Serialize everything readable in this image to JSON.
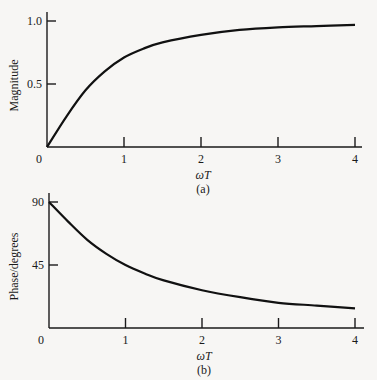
{
  "chart_data": [
    {
      "type": "line",
      "panel_label": "(a)",
      "title": "",
      "xlabel": "ωT",
      "ylabel": "Magnitude",
      "xlim": [
        0,
        4
      ],
      "ylim": [
        0,
        1.0
      ],
      "x_ticks": [
        "0",
        "1",
        "2",
        "3",
        "4"
      ],
      "y_ticks": [
        "0.5",
        "1.0"
      ],
      "origin_label": "0",
      "grid": false,
      "series": [
        {
          "name": "Magnitude",
          "x": [
            0,
            0.25,
            0.5,
            0.75,
            1.0,
            1.25,
            1.5,
            2.0,
            2.5,
            3.0,
            3.5,
            4.0
          ],
          "values": [
            0,
            0.24,
            0.45,
            0.6,
            0.71,
            0.78,
            0.83,
            0.89,
            0.93,
            0.95,
            0.96,
            0.97
          ]
        }
      ]
    },
    {
      "type": "line",
      "panel_label": "(b)",
      "title": "",
      "xlabel": "ωT",
      "ylabel": "Phase/degrees",
      "xlim": [
        0,
        4
      ],
      "ylim": [
        0,
        90
      ],
      "x_ticks": [
        "0",
        "1",
        "2",
        "3",
        "4"
      ],
      "y_ticks": [
        "45",
        "90"
      ],
      "origin_label": "0",
      "grid": false,
      "series": [
        {
          "name": "Phase",
          "x": [
            0,
            0.25,
            0.5,
            0.75,
            1.0,
            1.25,
            1.5,
            2.0,
            2.5,
            3.0,
            3.5,
            4.0
          ],
          "values": [
            90,
            76,
            63,
            53,
            45,
            39,
            34,
            27,
            22,
            18,
            16,
            14
          ]
        }
      ]
    }
  ]
}
